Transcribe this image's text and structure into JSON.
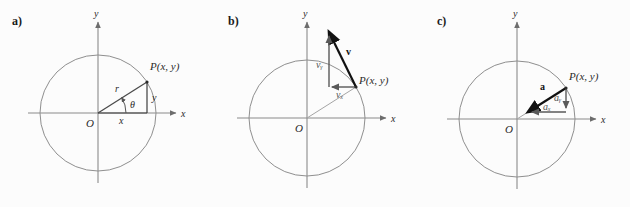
{
  "figure": {
    "background": "#fcfcfc",
    "circle_color": "#8a8a8a",
    "axis_color": "#8a8a8a",
    "radius_color": "#777777",
    "vector_color": "#111111",
    "component_color": "#666666"
  },
  "panels": [
    {
      "id": "a",
      "label": "a)",
      "axis_x_label": "x",
      "axis_y_label": "y",
      "origin_label": "O",
      "point_label": "P(x, y)",
      "radius_label": "r",
      "angle_label": "θ",
      "leg_x_label": "x",
      "leg_y_label": "y"
    },
    {
      "id": "b",
      "label": "b)",
      "axis_x_label": "x",
      "axis_y_label": "y",
      "origin_label": "O",
      "point_label": "P(x, y)",
      "vector_label": "v",
      "component_x_label": "vₓ",
      "component_y_label": "vᵧ"
    },
    {
      "id": "c",
      "label": "c)",
      "axis_x_label": "x",
      "axis_y_label": "y",
      "origin_label": "O",
      "point_label": "P(x, y)",
      "vector_label": "a",
      "component_x_label": "aₓ",
      "component_y_label": "aᵧ"
    }
  ]
}
